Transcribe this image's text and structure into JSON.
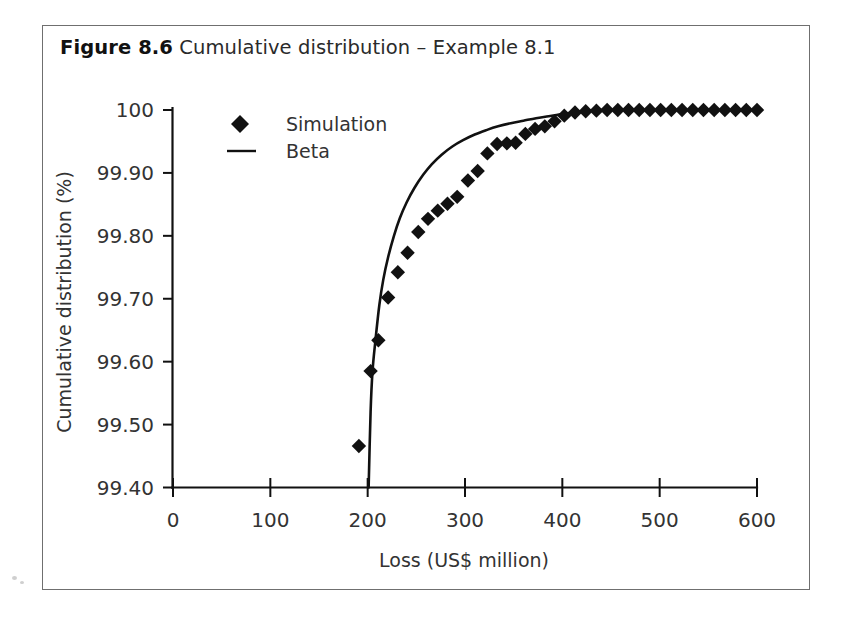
{
  "figure": {
    "number_label": "Figure 8.6",
    "caption": "Cumulative distribution – Example 8.1"
  },
  "chart_data": {
    "type": "scatter",
    "title": "Cumulative distribution – Example 8.1",
    "xlabel": "Loss (US$ million)",
    "ylabel": "Cumulative distribution (%)",
    "xlim": [
      0,
      600
    ],
    "ylim": [
      99.4,
      100.0
    ],
    "xticks": [
      0,
      100,
      200,
      300,
      400,
      500,
      600
    ],
    "xtick_labels": [
      "0",
      "100",
      "200",
      "300",
      "400",
      "500",
      "600"
    ],
    "yticks": [
      99.4,
      99.5,
      99.6,
      99.7,
      99.8,
      99.9,
      100.0
    ],
    "ytick_labels": [
      "99.40",
      "99.50",
      "99.60",
      "99.70",
      "99.80",
      "99.90",
      "100"
    ],
    "grid": false,
    "legend_position": "top-left-inside",
    "series": [
      {
        "name": "Simulation",
        "type": "scatter",
        "marker": "diamond",
        "color": "#111111",
        "points": [
          [
            191,
            99.466
          ],
          [
            203,
            99.585
          ],
          [
            211,
            99.634
          ],
          [
            221,
            99.702
          ],
          [
            231,
            99.742
          ],
          [
            241,
            99.773
          ],
          [
            252,
            99.806
          ],
          [
            262,
            99.827
          ],
          [
            272,
            99.84
          ],
          [
            282,
            99.851
          ],
          [
            292,
            99.862
          ],
          [
            303,
            99.888
          ],
          [
            313,
            99.903
          ],
          [
            323,
            99.931
          ],
          [
            333,
            99.946
          ],
          [
            343,
            99.947
          ],
          [
            352,
            99.948
          ],
          [
            362,
            99.962
          ],
          [
            372,
            99.97
          ],
          [
            382,
            99.974
          ],
          [
            392,
            99.982
          ],
          [
            402,
            99.991
          ],
          [
            413,
            99.996
          ],
          [
            424,
            99.998
          ],
          [
            435,
            99.999
          ],
          [
            446,
            100.0
          ],
          [
            457,
            100.0
          ],
          [
            468,
            100.0
          ],
          [
            479,
            100.0
          ],
          [
            490,
            100.0
          ],
          [
            501,
            100.0
          ],
          [
            512,
            100.0
          ],
          [
            523,
            100.0
          ],
          [
            534,
            100.0
          ],
          [
            545,
            100.0
          ],
          [
            556,
            100.0
          ],
          [
            567,
            100.0
          ],
          [
            578,
            100.0
          ],
          [
            589,
            100.0
          ],
          [
            600,
            100.0
          ]
        ]
      },
      {
        "name": "Beta",
        "type": "line",
        "color": "#111111",
        "points": [
          [
            201,
            99.4
          ],
          [
            203,
            99.52
          ],
          [
            205,
            99.585
          ],
          [
            208,
            99.634
          ],
          [
            212,
            99.69
          ],
          [
            216,
            99.73
          ],
          [
            221,
            99.766
          ],
          [
            227,
            99.8
          ],
          [
            233,
            99.828
          ],
          [
            240,
            99.853
          ],
          [
            248,
            99.876
          ],
          [
            257,
            99.897
          ],
          [
            266,
            99.914
          ],
          [
            276,
            99.929
          ],
          [
            287,
            99.942
          ],
          [
            298,
            99.952
          ],
          [
            310,
            99.961
          ],
          [
            322,
            99.968
          ],
          [
            334,
            99.974
          ],
          [
            347,
            99.979
          ],
          [
            360,
            99.983
          ],
          [
            373,
            99.987
          ],
          [
            386,
            99.99
          ],
          [
            398,
            99.993
          ],
          [
            410,
            99.996
          ],
          [
            420,
            99.998
          ],
          [
            430,
            99.999
          ],
          [
            440,
            100.0
          ]
        ]
      }
    ],
    "legend": [
      {
        "label": "Simulation",
        "marker": "diamond"
      },
      {
        "label": "Beta",
        "marker": "line"
      }
    ]
  },
  "axis_labels": {
    "x": "Loss (US$ million)",
    "y": "Cumulative distribution (%)"
  }
}
